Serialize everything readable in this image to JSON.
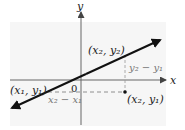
{
  "diagram": {
    "title": "",
    "axes": {
      "x_label": "x",
      "y_label": "y",
      "origin_label": "0"
    },
    "points": [
      {
        "name": "point-x2-y2",
        "label": "(x₂, y₂)"
      },
      {
        "name": "point-x1-y1",
        "label": "(x₁, y₁)"
      },
      {
        "name": "point-x2-y1",
        "label": "(x₂, y₁)"
      }
    ],
    "dimensions": {
      "rise_label": "y₂ − y₁",
      "run_label": "x₂ − x₁"
    },
    "colors": {
      "line": "#111111",
      "axis": "#555555",
      "dashed": "#777777",
      "panel": "#f6f6f6"
    }
  }
}
